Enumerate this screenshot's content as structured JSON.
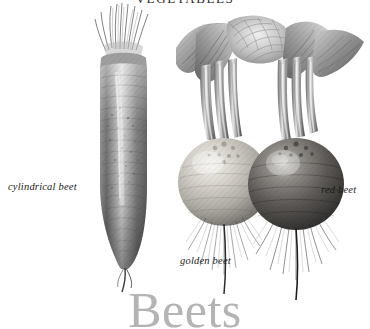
{
  "plate": {
    "top_heading": "VEGETABLES",
    "title": "Beets",
    "title_color": "#b4b4b4",
    "background_color": "#ffffff",
    "ink_color": "#1c1c1c",
    "style": "grayscale engraving / botanical illustration"
  },
  "labels": {
    "cylindrical": "cylindrical beet",
    "golden": "golden beet",
    "red": "red beet"
  },
  "specimens": [
    {
      "name": "cylindrical beet",
      "label": "cylindrical beet",
      "shape": "elongated cylindrical taproot with cut stems on top and thin root tail",
      "tone": "light to mid gray, banded"
    },
    {
      "name": "golden beet",
      "label": "golden beet",
      "shape": "round globe root with leafy crown and fibrous roots",
      "tone": "light gray / pale"
    },
    {
      "name": "red beet",
      "label": "red beet",
      "shape": "round globe root with leafy crown and fibrous roots",
      "tone": "dark gray / deep"
    }
  ]
}
